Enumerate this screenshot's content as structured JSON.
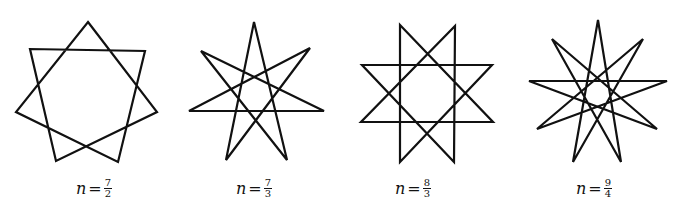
{
  "figures": [
    {
      "label": {
        "var": "n",
        "eq": "=",
        "num": "7",
        "den": "2"
      },
      "label_pos": [
        76,
        186
      ],
      "vertices": [
        [
          88,
          22
        ],
        [
          145,
          51
        ],
        [
          157,
          112
        ],
        [
          118,
          162
        ],
        [
          56,
          161
        ],
        [
          16,
          112
        ],
        [
          30,
          49
        ]
      ],
      "step": 2
    },
    {
      "label": {
        "var": "n",
        "eq": "=",
        "num": "7",
        "den": "3"
      },
      "label_pos": [
        236,
        186
      ],
      "vertices": [
        [
          254,
          22
        ],
        [
          310,
          48
        ],
        [
          324,
          111
        ],
        [
          287,
          160
        ],
        [
          226,
          160
        ],
        [
          189,
          111
        ],
        [
          201,
          51
        ]
      ],
      "step": 3
    },
    {
      "label": {
        "var": "n",
        "eq": "=",
        "num": "8",
        "den": "3"
      },
      "label_pos": [
        395,
        186
      ],
      "vertices": [
        [
          400,
          25
        ],
        [
          455,
          26
        ],
        [
          492,
          65
        ],
        [
          493,
          122
        ],
        [
          454,
          162
        ],
        [
          400,
          162
        ],
        [
          361,
          122
        ],
        [
          362,
          65
        ]
      ],
      "step": 3
    },
    {
      "label": {
        "var": "n",
        "eq": "=",
        "num": "9",
        "den": "4"
      },
      "label_pos": [
        576,
        186
      ],
      "vertices": [
        [
          598,
          20
        ],
        [
          643,
          39
        ],
        [
          667,
          81
        ],
        [
          657,
          129
        ],
        [
          621,
          162
        ],
        [
          573,
          162
        ],
        [
          537,
          129
        ],
        [
          529,
          81
        ],
        [
          552,
          39
        ]
      ],
      "step": 4
    }
  ],
  "stroke_color": "#111111",
  "stroke_width": 2.2
}
